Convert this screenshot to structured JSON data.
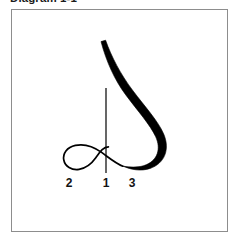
{
  "caption": {
    "title": "Diagram 1-1"
  },
  "figure": {
    "name": "calligraphy-stroke-diagram",
    "frame": {
      "border_color": "#8d8d8d",
      "background_color": "#ffffff"
    },
    "ink_color": "#000000",
    "stroke_labels": [
      {
        "id": "2",
        "text": "2"
      },
      {
        "id": "1",
        "text": "1"
      },
      {
        "id": "3",
        "text": "3"
      }
    ],
    "parts": [
      {
        "name": "main-thick-stroke",
        "weight": "thick"
      },
      {
        "name": "lower-loop-stroke",
        "weight": "thin"
      },
      {
        "name": "vertical-guide-stroke",
        "weight": "thin"
      }
    ]
  }
}
